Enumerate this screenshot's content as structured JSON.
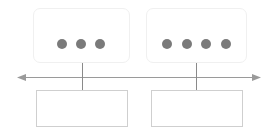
{
  "diagram": {
    "type": "timeline-with-nodes",
    "colors": {
      "dot": "#7a7a7a",
      "line": "#9a9a9a",
      "top_box_border": "#f0f0f0",
      "bottom_box_border": "#cfcfcf"
    },
    "axis": {
      "direction": "bidirectional-horizontal",
      "arrowheads": [
        "left",
        "right"
      ]
    },
    "nodes": [
      {
        "top_box": {
          "dots": 3
        },
        "bottom_box": {
          "text": ""
        }
      },
      {
        "top_box": {
          "dots": 4
        },
        "bottom_box": {
          "text": ""
        }
      }
    ]
  }
}
